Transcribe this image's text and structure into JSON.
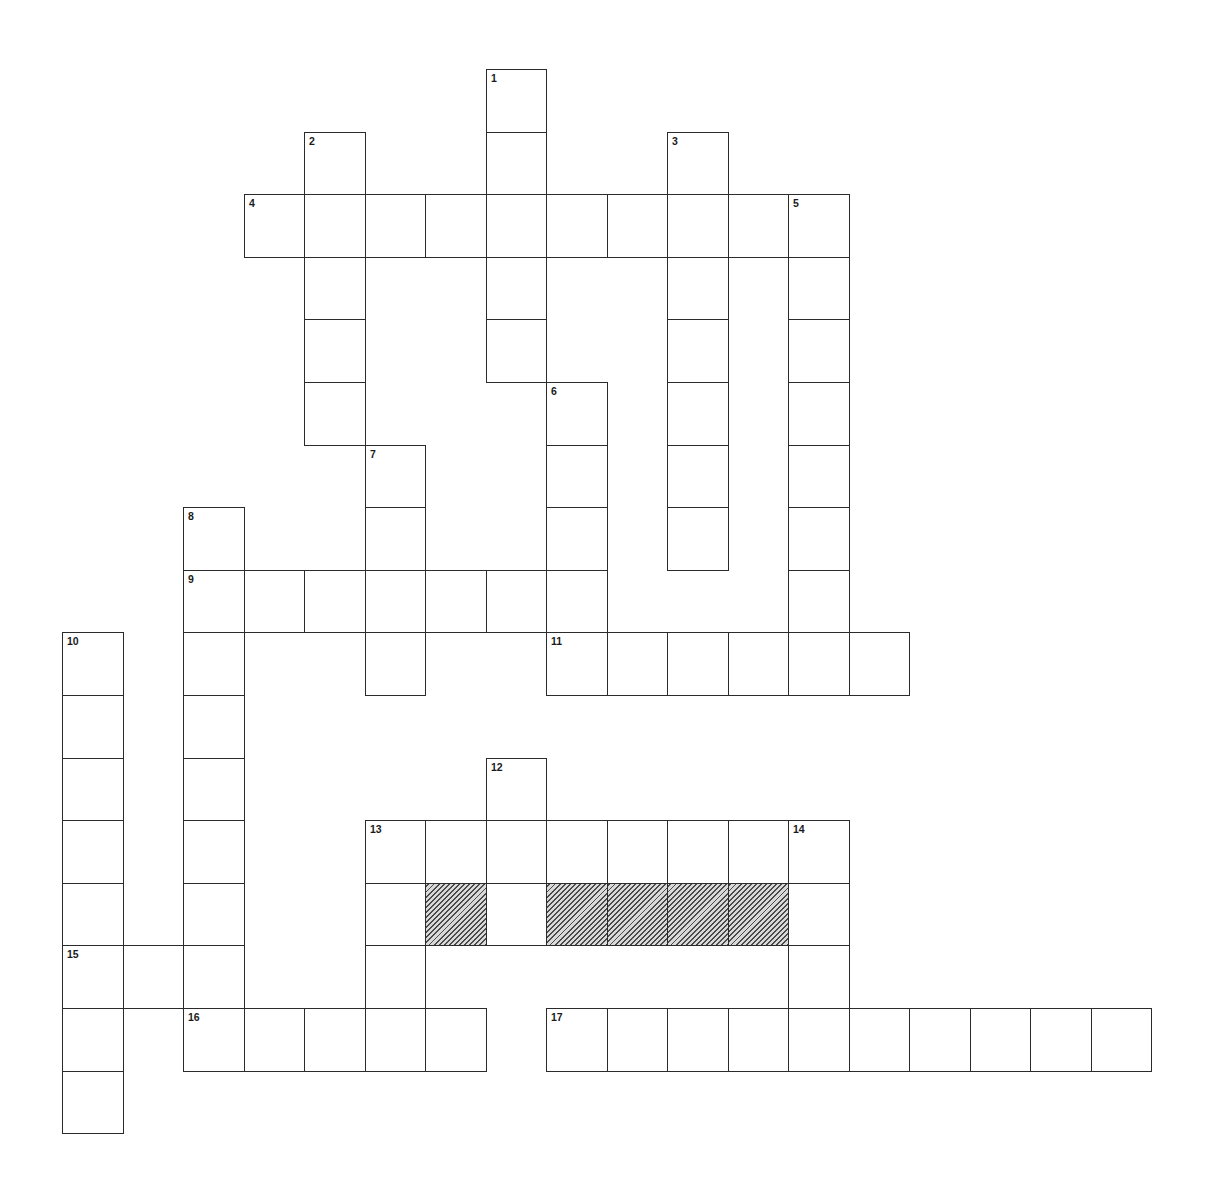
{
  "puzzle": {
    "type": "crossword",
    "grid": {
      "origin_x": 62,
      "origin_y": 69,
      "col_pitch": 60.5,
      "row_pitch": 62.6,
      "columns": 18,
      "rows": 17
    },
    "colors": {
      "line": "#2b2b2b",
      "cell_fill": "#ffffff",
      "hatch_dark": "#4a4a4a",
      "hatch_light": "#d9d9d9",
      "label": "#1a1a1a"
    },
    "entries": [
      {
        "number": "1",
        "direction": "down",
        "row": 0,
        "col": 7,
        "length": 5
      },
      {
        "number": "2",
        "direction": "down",
        "row": 1,
        "col": 4,
        "length": 5
      },
      {
        "number": "3",
        "direction": "down",
        "row": 1,
        "col": 10,
        "length": 7
      },
      {
        "number": "4",
        "direction": "across",
        "row": 2,
        "col": 3,
        "length": 10
      },
      {
        "number": "5",
        "direction": "down",
        "row": 2,
        "col": 12,
        "length": 8
      },
      {
        "number": "6",
        "direction": "down",
        "row": 5,
        "col": 8,
        "length": 5
      },
      {
        "number": "7",
        "direction": "down",
        "row": 6,
        "col": 5,
        "length": 4
      },
      {
        "number": "8",
        "direction": "down",
        "row": 7,
        "col": 2,
        "length": 9
      },
      {
        "number": "9",
        "direction": "across",
        "row": 8,
        "col": 2,
        "length": 7
      },
      {
        "number": "10",
        "direction": "down",
        "row": 9,
        "col": 0,
        "length": 8
      },
      {
        "number": "11",
        "direction": "across",
        "row": 9,
        "col": 8,
        "length": 6
      },
      {
        "number": "12",
        "direction": "down",
        "row": 11,
        "col": 7,
        "length": 3
      },
      {
        "number": "13",
        "direction": "across",
        "row": 12,
        "col": 5,
        "length": 8
      },
      {
        "number": "13",
        "direction": "down",
        "row": 12,
        "col": 5,
        "length": 4
      },
      {
        "number": "14",
        "direction": "down",
        "row": 12,
        "col": 12,
        "length": 4
      },
      {
        "number": "15",
        "direction": "across",
        "row": 14,
        "col": 0,
        "length": 3
      },
      {
        "number": "16",
        "direction": "across",
        "row": 15,
        "col": 2,
        "length": 5
      },
      {
        "number": "17",
        "direction": "across",
        "row": 15,
        "col": 8,
        "length": 10
      }
    ],
    "shaded_cells": [
      {
        "row": 13,
        "col": 6
      },
      {
        "row": 13,
        "col": 8
      },
      {
        "row": 13,
        "col": 9
      },
      {
        "row": 13,
        "col": 10
      },
      {
        "row": 13,
        "col": 11
      }
    ],
    "labels": {
      "0,7": "1",
      "1,4": "2",
      "1,10": "3",
      "2,3": "4",
      "2,12": "5",
      "5,8": "6",
      "6,5": "7",
      "7,2": "8",
      "8,2": "9",
      "9,0": "10",
      "9,8": "11",
      "11,7": "12",
      "12,5": "13",
      "12,12": "14",
      "14,0": "15",
      "15,2": "16",
      "15,8": "17"
    }
  }
}
